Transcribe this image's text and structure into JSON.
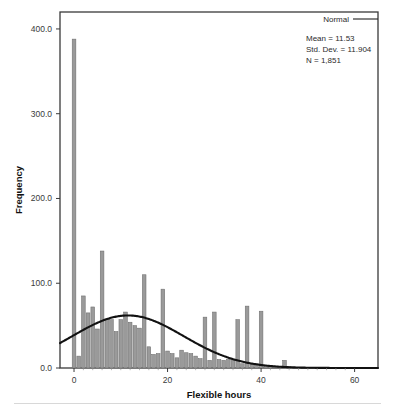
{
  "figure": {
    "type": "histogram-with-normal-curve",
    "background": "#ffffff"
  },
  "legend": {
    "label": "Normal",
    "line_color": "#222222",
    "position": "top-right"
  },
  "annotations": {
    "mean_label": "Mean = 11.53",
    "stddev_label": "Std. Dev. = 11.904",
    "n_label": "N = 1,851"
  },
  "axes": {
    "x_title": "Flexible hours",
    "y_title": "Frequency",
    "x_ticks": [
      "0",
      "20",
      "40",
      "60"
    ],
    "x_tick_values": [
      0,
      20,
      40,
      60
    ],
    "y_ticks": [
      "0.0",
      "100.0",
      "200.0",
      "300.0",
      "400.0"
    ],
    "y_tick_values": [
      0,
      100,
      200,
      300,
      400
    ],
    "frame_color": "#3a3a3a"
  },
  "chart_data": {
    "type": "bar",
    "title": "",
    "subtitle": "",
    "xlabel": "Flexible hours",
    "ylabel": "Frequency",
    "xlim": [
      -3,
      65
    ],
    "ylim": [
      0,
      420
    ],
    "grid": false,
    "legend_position": "top-right",
    "bar_color": "#9a9a9a",
    "bar_edge_color": "#6d6d6d",
    "curve_color": "#111111",
    "bin_width": 1,
    "statistics": {
      "mean": 11.53,
      "std_dev": 11.904,
      "n": 1851
    },
    "categories": [
      0,
      1,
      2,
      3,
      4,
      5,
      6,
      7,
      8,
      9,
      10,
      11,
      12,
      13,
      14,
      15,
      16,
      17,
      18,
      19,
      20,
      21,
      22,
      23,
      24,
      25,
      26,
      27,
      28,
      29,
      30,
      31,
      32,
      33,
      34,
      35,
      36,
      37,
      38,
      39,
      40,
      41,
      42,
      43,
      44,
      45,
      46
    ],
    "values": [
      388,
      14,
      85,
      65,
      72,
      46,
      138,
      58,
      57,
      43,
      57,
      66,
      54,
      50,
      47,
      110,
      25,
      16,
      17,
      93,
      20,
      17,
      12,
      21,
      18,
      17,
      14,
      11,
      60,
      9,
      66,
      10,
      9,
      10,
      10,
      57,
      5,
      73,
      4,
      5,
      67,
      3,
      3,
      2,
      2,
      9,
      2
    ],
    "series": [
      {
        "name": "Flexible hours frequency",
        "values": [
          388,
          14,
          85,
          65,
          72,
          46,
          138,
          58,
          57,
          43,
          57,
          66,
          54,
          50,
          47,
          110,
          25,
          16,
          17,
          93,
          20,
          17,
          12,
          21,
          18,
          17,
          14,
          11,
          60,
          9,
          66,
          10,
          9,
          10,
          10,
          57,
          5,
          73,
          4,
          5,
          67,
          3,
          3,
          2,
          2,
          9,
          2
        ]
      }
    ],
    "normal_curve": {
      "name": "Normal",
      "mean": 11.53,
      "std_dev": 11.904,
      "peak_value": 62,
      "x": [
        -3,
        0,
        3,
        6,
        9,
        11.53,
        15,
        18,
        21,
        24,
        27,
        30,
        33,
        36,
        39,
        42,
        45,
        48,
        51,
        54,
        57,
        60,
        63
      ],
      "y": [
        15,
        21,
        31,
        43,
        54,
        62,
        59,
        52,
        43,
        33,
        23,
        15,
        9,
        5,
        3,
        1.5,
        0.7,
        0.3,
        0.1,
        0.0,
        0.0,
        0.0,
        0.0
      ]
    }
  }
}
